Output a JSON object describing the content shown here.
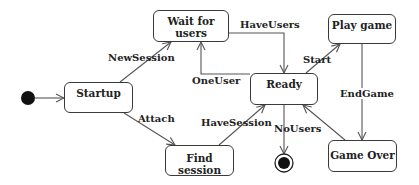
{
  "diagram": {
    "type": "uml-state-machine",
    "states": [
      {
        "id": "startup",
        "label": "Startup"
      },
      {
        "id": "wait",
        "label": "Wait for users"
      },
      {
        "id": "ready",
        "label": "Ready"
      },
      {
        "id": "play",
        "label": "Play game"
      },
      {
        "id": "find",
        "label": "Find session"
      },
      {
        "id": "gameover",
        "label": "Game Over"
      }
    ],
    "pseudostates": {
      "initial": "initial-state",
      "final": "final-state"
    },
    "transitions": [
      {
        "from": "initial",
        "to": "startup",
        "label": ""
      },
      {
        "from": "startup",
        "to": "wait",
        "label": "NewSession"
      },
      {
        "from": "startup",
        "to": "find",
        "label": "Attach"
      },
      {
        "from": "wait",
        "to": "ready",
        "label": "HaveUsers"
      },
      {
        "from": "ready",
        "to": "wait",
        "label": "OneUser"
      },
      {
        "from": "find",
        "to": "ready",
        "label": "HaveSession"
      },
      {
        "from": "ready",
        "to": "play",
        "label": "Start"
      },
      {
        "from": "ready",
        "to": "final",
        "label": "NoUsers"
      },
      {
        "from": "play",
        "to": "gameover",
        "label": "EndGame"
      },
      {
        "from": "gameover",
        "to": "ready",
        "label": ""
      }
    ]
  },
  "colors": {
    "line": "#555555",
    "text": "#222222",
    "dot": "#111111"
  }
}
